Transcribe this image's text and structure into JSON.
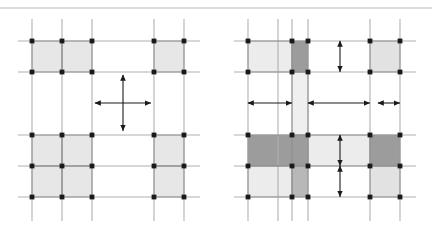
{
  "figure": {
    "top_rule": {
      "y": 8,
      "x1": 0,
      "x2": 432,
      "color": "#b9b9b9"
    },
    "palette": {
      "background": "#ffffff",
      "gridline": "#b0b0b0",
      "cell_border": "#8a8a8a",
      "node": "#1a1a1a",
      "arrow": "#1a1a1a",
      "shade_light": "#e7e7e7",
      "shade_pale": "#f0f0f0",
      "shade_mid": "#d2d2d2",
      "shade_dark": "#9c9c9c"
    },
    "panels": [
      {
        "name": "left-panel",
        "label": "left",
        "grid": {
          "x_lines": [
            32,
            62,
            92,
            154,
            184
          ],
          "y_lines": [
            41,
            72,
            135,
            166,
            197
          ],
          "line_extent": {
            "x_min": 18,
            "x_max": 200,
            "y_min": 19,
            "y_max": 221
          }
        },
        "cells": [
          {
            "name": "cell-tl-a",
            "x0": 32,
            "y0": 41,
            "x1": 62,
            "y1": 72,
            "fill": "#e7e7e7"
          },
          {
            "name": "cell-tl-b",
            "x0": 62,
            "y0": 41,
            "x1": 92,
            "y1": 72,
            "fill": "#e7e7e7"
          },
          {
            "name": "cell-tr",
            "x0": 154,
            "y0": 41,
            "x1": 184,
            "y1": 72,
            "fill": "#e7e7e7"
          },
          {
            "name": "cell-bl-a",
            "x0": 32,
            "y0": 135,
            "x1": 62,
            "y1": 166,
            "fill": "#e7e7e7"
          },
          {
            "name": "cell-bl-b",
            "x0": 62,
            "y0": 135,
            "x1": 92,
            "y1": 166,
            "fill": "#e7e7e7"
          },
          {
            "name": "cell-bl-c",
            "x0": 32,
            "y0": 166,
            "x1": 62,
            "y1": 197,
            "fill": "#e7e7e7"
          },
          {
            "name": "cell-bl-d",
            "x0": 62,
            "y0": 166,
            "x1": 92,
            "y1": 197,
            "fill": "#e7e7e7"
          },
          {
            "name": "cell-br-a",
            "x0": 154,
            "y0": 135,
            "x1": 184,
            "y1": 166,
            "fill": "#e7e7e7"
          },
          {
            "name": "cell-br-b",
            "x0": 154,
            "y0": 166,
            "x1": 184,
            "y1": 197,
            "fill": "#e7e7e7"
          }
        ],
        "nodes_x": [
          32,
          62,
          92,
          154,
          184
        ],
        "nodes_y": [
          41,
          72,
          135,
          166,
          197
        ],
        "arrows": [
          {
            "name": "horizontal-double-arrow",
            "orientation": "horizontal",
            "x0": 95,
            "x1": 151,
            "y": 103
          },
          {
            "name": "vertical-double-arrow",
            "orientation": "vertical",
            "y0": 75,
            "y1": 131,
            "x": 123
          }
        ]
      },
      {
        "name": "right-panel",
        "label": "right",
        "grid": {
          "x_lines": [
            248,
            278,
            292,
            308,
            370,
            400
          ],
          "y_lines": [
            41,
            72,
            135,
            166,
            197
          ],
          "line_extent": {
            "x_min": 234,
            "x_max": 416,
            "y_min": 19,
            "y_max": 221
          }
        },
        "cells": [
          {
            "name": "cell-r-tl-pale",
            "x0": 248,
            "y0": 41,
            "x1": 292,
            "y1": 72,
            "fill": "#ececec"
          },
          {
            "name": "cell-r-top-dark",
            "x0": 292,
            "y0": 41,
            "x1": 308,
            "y1": 72,
            "fill": "#9c9c9c"
          },
          {
            "name": "cell-r-tr",
            "x0": 370,
            "y0": 41,
            "x1": 400,
            "y1": 72,
            "fill": "#e2e2e2"
          },
          {
            "name": "cell-r-spine-upper",
            "x0": 292,
            "y0": 72,
            "x1": 308,
            "y1": 135,
            "fill": "#efefef"
          },
          {
            "name": "cell-r-mid-left-dark",
            "x0": 248,
            "y0": 135,
            "x1": 292,
            "y1": 166,
            "fill": "#9c9c9c"
          },
          {
            "name": "cell-r-mid-center-dark",
            "x0": 292,
            "y0": 135,
            "x1": 308,
            "y1": 166,
            "fill": "#9c9c9c"
          },
          {
            "name": "cell-r-mid-band",
            "x0": 308,
            "y0": 135,
            "x1": 370,
            "y1": 166,
            "fill": "#ececec"
          },
          {
            "name": "cell-r-mid-right-dark",
            "x0": 370,
            "y0": 135,
            "x1": 400,
            "y1": 166,
            "fill": "#9c9c9c"
          },
          {
            "name": "cell-r-bl-pale",
            "x0": 248,
            "y0": 166,
            "x1": 292,
            "y1": 197,
            "fill": "#ececec"
          },
          {
            "name": "cell-r-bottom-spine",
            "x0": 292,
            "y0": 166,
            "x1": 308,
            "y1": 197,
            "fill": "#b8b8b8"
          },
          {
            "name": "cell-r-br",
            "x0": 370,
            "y0": 166,
            "x1": 400,
            "y1": 197,
            "fill": "#e2e2e2"
          }
        ],
        "nodes_x": [
          248,
          292,
          308,
          370,
          400
        ],
        "nodes_y": [
          41,
          72,
          135,
          166,
          197
        ],
        "arrows": [
          {
            "name": "h-arrow-left-long",
            "orientation": "horizontal",
            "x0": 248,
            "x1": 292,
            "y": 103
          },
          {
            "name": "h-arrow-center",
            "orientation": "horizontal",
            "x0": 308,
            "x1": 370,
            "y": 103
          },
          {
            "name": "h-arrow-right-short",
            "orientation": "horizontal",
            "x0": 378,
            "x1": 400,
            "y": 103
          },
          {
            "name": "v-arrow-upper",
            "orientation": "vertical",
            "y0": 41,
            "y1": 72,
            "x": 340
          },
          {
            "name": "v-arrow-middle",
            "orientation": "vertical",
            "y0": 135,
            "y1": 166,
            "x": 340
          },
          {
            "name": "v-arrow-lower",
            "orientation": "vertical",
            "y0": 166,
            "y1": 197,
            "x": 340
          }
        ]
      }
    ]
  }
}
